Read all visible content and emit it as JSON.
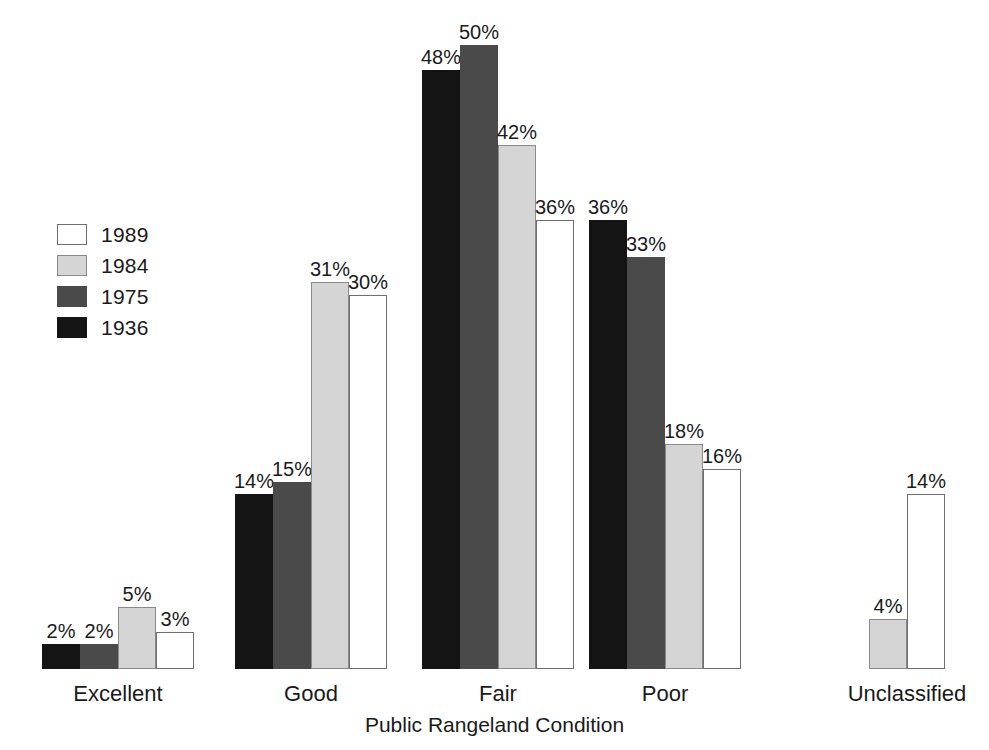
{
  "chart_data": {
    "type": "bar",
    "title": "",
    "subtitle": "",
    "xlabel": "Public Rangeland Condition",
    "ylabel": "",
    "ylim": [
      0,
      50
    ],
    "grid": false,
    "legend_position": "left-middle",
    "value_label_suffix": "%",
    "categories": [
      "Excellent",
      "Good",
      "Fair",
      "Poor",
      "Unclassified"
    ],
    "series": [
      {
        "name": "1936",
        "color": "#141414",
        "border": "#141414",
        "values": [
          2,
          14,
          48,
          36,
          null
        ],
        "labels": [
          "2%",
          "14%",
          "48%",
          "36%",
          ""
        ]
      },
      {
        "name": "1975",
        "color": "#4a4a4a",
        "border": "#4a4a4a",
        "values": [
          2,
          15,
          50,
          33,
          null
        ],
        "labels": [
          "2%",
          "15%",
          "50%",
          "33%",
          ""
        ]
      },
      {
        "name": "1984",
        "color": "#d5d5d5",
        "border": "#8a8a8a",
        "values": [
          5,
          31,
          42,
          18,
          4
        ],
        "labels": [
          "5%",
          "31%",
          "42%",
          "18%",
          "4%"
        ]
      },
      {
        "name": "1989",
        "color": "#ffffff",
        "border": "#6e6e6e",
        "values": [
          3,
          30,
          36,
          16,
          14
        ],
        "labels": [
          "3%",
          "30%",
          "36%",
          "16%",
          "14%"
        ]
      }
    ]
  },
  "legend": {
    "items": [
      {
        "label": "1989",
        "color": "#ffffff",
        "border": "#6e6e6e"
      },
      {
        "label": "1984",
        "color": "#d5d5d5",
        "border": "#8a8a8a"
      },
      {
        "label": "1975",
        "color": "#4a4a4a",
        "border": "#4a4a4a"
      },
      {
        "label": "1936",
        "color": "#141414",
        "border": "#141414"
      }
    ]
  },
  "axis": {
    "xlabel": "Public Rangeland Condition"
  },
  "layout": {
    "baseline_y": 669,
    "px_per_percent": 12.48,
    "bar_width": 38,
    "group_left": [
      42,
      235,
      422,
      589,
      869
    ]
  }
}
